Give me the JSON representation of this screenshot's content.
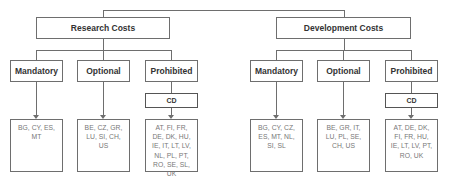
{
  "diagram": {
    "left": {
      "title": "Research Costs",
      "categories": [
        {
          "label": "Mandatory",
          "countries": "BG, CY, ES, MT"
        },
        {
          "label": "Optional",
          "countries": "BE, CZ, GR, LU, SI, CH, US"
        },
        {
          "label": "Prohibited",
          "sub_label": "CD",
          "countries": "AT, FI, FR, DE, DK, HU, IE, IT, LT, LV, NL, PL, PT, RO, SE, SL, UK"
        }
      ]
    },
    "right": {
      "title": "Development Costs",
      "categories": [
        {
          "label": "Mandatory",
          "countries": "BG, CY, CZ, ES, MT, NL, SI, SL"
        },
        {
          "label": "Optional",
          "countries": "BE, GR, IT, LU, PL, SE, CH, US"
        },
        {
          "label": "Prohibited",
          "sub_label": "CD",
          "countries": "AT, DE, DK, FI, FR, HU, IE, LT, LV, PT, RO, UK"
        }
      ]
    }
  }
}
